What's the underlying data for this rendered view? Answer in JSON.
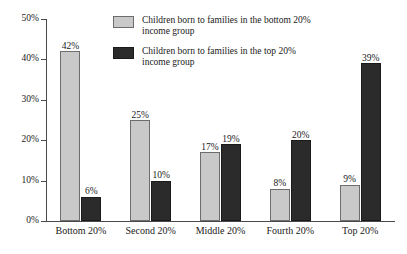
{
  "chart_data": {
    "type": "bar",
    "title": "",
    "subtitle": "",
    "xlabel": "",
    "ylabel": "",
    "ylim": [
      0,
      50
    ],
    "ytick_labels": [
      "0%",
      "10%",
      "20%",
      "30%",
      "40%",
      "50%"
    ],
    "ytick_values": [
      0,
      10,
      20,
      30,
      40,
      50
    ],
    "grid": false,
    "legend_position": "top-center-inside",
    "categories": [
      "Bottom 20%",
      "Second 20%",
      "Middle 20%",
      "Fourth 20%",
      "Top 20%"
    ],
    "series": [
      {
        "name": "Children born to families in the bottom 20% income group",
        "color": "#c9c9c9",
        "values": [
          42,
          25,
          17,
          8,
          9
        ],
        "value_labels": [
          "42%",
          "25%",
          "17%",
          "8%",
          "9%"
        ]
      },
      {
        "name": "Children born to families in the top 20% income group",
        "color": "#2b2b2b",
        "values": [
          6,
          10,
          19,
          20,
          39
        ],
        "value_labels": [
          "6%",
          "10%",
          "19%",
          "20%",
          "39%"
        ]
      }
    ]
  },
  "legend": {
    "items": [
      {
        "swatch": "light",
        "line1": "Children born to families in the bottom 20%",
        "line2": "income group"
      },
      {
        "swatch": "dark",
        "line1": "Children born to families in the top 20%",
        "line2": "income group"
      }
    ]
  }
}
